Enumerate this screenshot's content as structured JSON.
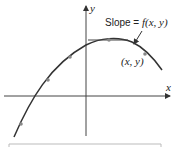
{
  "diagram": {
    "axes": {
      "x_label": "x",
      "y_label": "y"
    },
    "annotation": {
      "slope_prefix": "Slope = ",
      "slope_func": "f(x, y)",
      "point_label": "(x, y)"
    },
    "colors": {
      "curve": "#333333",
      "axis": "#333333",
      "dot": "#888888",
      "frame": "#bbbbbb"
    }
  }
}
